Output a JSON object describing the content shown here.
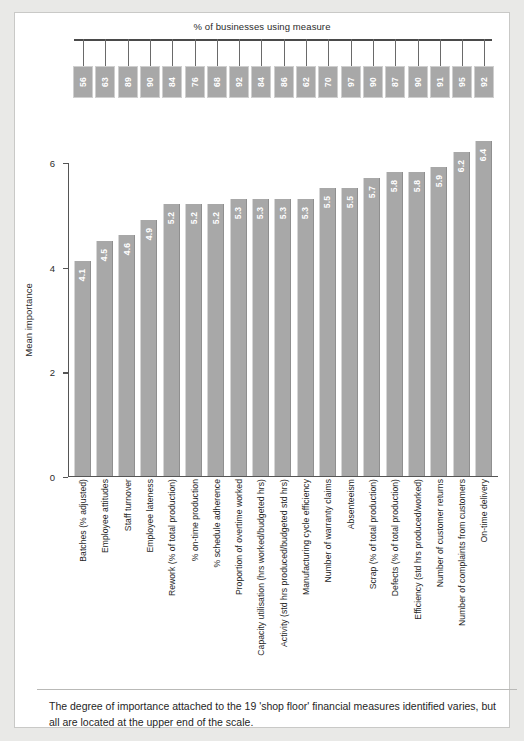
{
  "chart_data": {
    "type": "bar",
    "title": "",
    "pct_axis_title": "% of businesses using measure",
    "ylabel": "Mean importance",
    "xlabel": "",
    "ylim": [
      0,
      6
    ],
    "yticks": [
      "0",
      "2",
      "4",
      "6"
    ],
    "ytick_values": [
      0,
      2,
      4,
      6
    ],
    "grid": false,
    "legend": "none",
    "categories": [
      "Batches (% adjusted)",
      "Employee attitudes",
      "Staff turnover",
      "Employee lateness",
      "Rework (% of total production)",
      "% on-time production",
      "% schedule adherence",
      "Proportion of overtime worked",
      "Capacity utilisation (hrs worked/budgeted hrs)",
      "Activity (std hrs produced/budgeted std hrs)",
      "Manufacturing cycle efficiency",
      "Number of warranty claims",
      "Absenteeism",
      "Scrap (% of total production)",
      "Defects (% of total production)",
      "Efficiency (std hrs produced/worked)",
      "Number of customer returns",
      "Number of complaints from customers",
      "On-time delivery"
    ],
    "values": [
      4.1,
      4.5,
      4.6,
      4.9,
      5.2,
      5.2,
      5.2,
      5.3,
      5.3,
      5.3,
      5.3,
      5.5,
      5.5,
      5.7,
      5.8,
      5.8,
      5.9,
      6.2,
      6.4
    ],
    "value_labels": [
      "4.1",
      "4.5",
      "4.6",
      "4.9",
      "5.2",
      "5.2",
      "5.2",
      "5.3",
      "5.3",
      "5.3",
      "5.3",
      "5.5",
      "5.5",
      "5.7",
      "5.8",
      "5.8",
      "5.9",
      "6.2",
      "6.4"
    ],
    "pct_values": [
      56,
      63,
      89,
      90,
      84,
      76,
      68,
      92,
      84,
      86,
      62,
      70,
      97,
      90,
      87,
      90,
      91,
      95,
      92
    ],
    "pct_labels": [
      "56",
      "63",
      "89",
      "90",
      "84",
      "76",
      "68",
      "92",
      "84",
      "86",
      "62",
      "70",
      "97",
      "90",
      "87",
      "90",
      "91",
      "95",
      "92"
    ],
    "bar_color": "#a8a8a8",
    "value_label_color": "#ffffff",
    "axis_color": "#555555"
  },
  "caption": {
    "text": "The degree of importance attached to the 19 'shop floor' financial measures identified varies, but all are located at the upper end of the scale."
  }
}
